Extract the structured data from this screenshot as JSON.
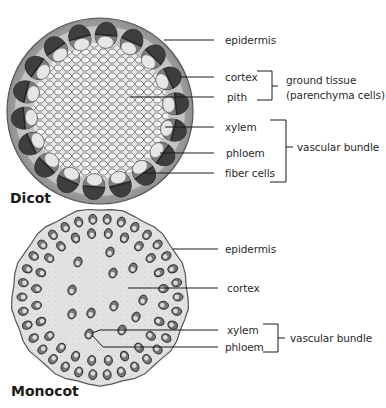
{
  "dicot": {
    "title": "Dicot",
    "labels": {
      "epidermis": "epidermis",
      "cortex": "cortex",
      "pith": "pith",
      "xylem": "xylem",
      "phloem": "phloem",
      "fiber_cells": "fiber cells"
    },
    "groups": {
      "ground_tissue_line1": "ground tissue",
      "ground_tissue_line2": "(parenchyma cells)",
      "vascular_bundle": "vascular bundle"
    }
  },
  "monocot": {
    "title": "Monocot",
    "labels": {
      "epidermis": "epidermis",
      "cortex": "cortex",
      "xylem": "xylem",
      "phloem": "phloem"
    },
    "groups": {
      "vascular_bundle": "vascular bundle"
    }
  },
  "colors": {
    "outline": "#4a4a4a",
    "cortex_fill": "#9a9a9a",
    "pith_fill": "#dcdcdc",
    "bundle_dark": "#3e3e3e",
    "bundle_light": "#e6e6e6",
    "monocot_fill": "#e4e4e4",
    "leader_line": "#1a1a1a"
  }
}
